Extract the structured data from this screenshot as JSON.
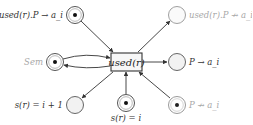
{
  "diagram": {
    "type": "petri-net",
    "transition": {
      "label": "used(r)",
      "x": 111,
      "y": 53,
      "w": 31,
      "h": 18
    },
    "places": [
      {
        "id": "p_used_to",
        "label": "used(r).P → a_i",
        "cx": 75,
        "cy": 15,
        "token": true,
        "faded": false,
        "label_side": "left"
      },
      {
        "id": "p_used_notto",
        "label": "used(r).P ↛ a_i",
        "cx": 177,
        "cy": 15,
        "token": false,
        "faded": true,
        "label_side": "right"
      },
      {
        "id": "p_sem",
        "label": "Sem",
        "cx": 55,
        "cy": 62,
        "token": true,
        "faded": false,
        "label_side": "left",
        "label_faded": true
      },
      {
        "id": "p_to",
        "label": "P → a_i",
        "cx": 177,
        "cy": 62,
        "token": false,
        "faded": false,
        "label_side": "right"
      },
      {
        "id": "p_s_next",
        "label": "s(r) = i + 1",
        "cx": 75,
        "cy": 105,
        "token": false,
        "faded": false,
        "label_side": "left"
      },
      {
        "id": "p_s_cur",
        "label": "s(r) = i",
        "cx": 126,
        "cy": 103,
        "token": true,
        "faded": false,
        "label_side": "below"
      },
      {
        "id": "p_notto",
        "label": "P ↛ a_i",
        "cx": 177,
        "cy": 105,
        "token": true,
        "faded": true,
        "label_side": "right"
      }
    ],
    "arcs": [
      {
        "from": "p_used_to",
        "to": "transition"
      },
      {
        "from": "transition",
        "to": "p_used_notto"
      },
      {
        "from": "p_sem",
        "to": "transition"
      },
      {
        "from": "transition",
        "to": "p_sem"
      },
      {
        "from": "transition",
        "to": "p_to"
      },
      {
        "from": "transition",
        "to": "p_s_next"
      },
      {
        "from": "p_s_cur",
        "to": "transition"
      },
      {
        "from": "p_notto",
        "to": "transition"
      }
    ],
    "colors": {
      "stroke": "#333333",
      "faded_stroke": "#a0a0a0",
      "empty_fill": "#f2f2f2",
      "token": "#111111"
    }
  }
}
